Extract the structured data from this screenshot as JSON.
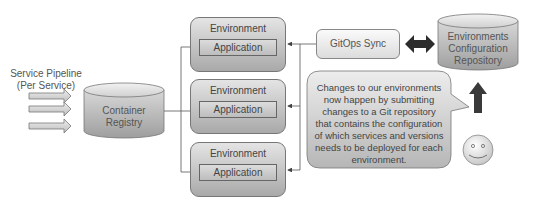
{
  "pipeline": {
    "title_line1": "Service Pipeline",
    "title_line2": "(Per Service)",
    "arrow_count": 3
  },
  "container_registry": {
    "line1": "Container",
    "line2": "Registry"
  },
  "environments": [
    {
      "title": "Environment",
      "app": "Application"
    },
    {
      "title": "Environment",
      "app": "Application"
    },
    {
      "title": "Environment",
      "app": "Application"
    }
  ],
  "gitops_sync": {
    "label": "GitOps Sync"
  },
  "config_repo": {
    "line1": "Environments",
    "line2": "Configuration",
    "line3": "Repository"
  },
  "callout": {
    "text": "Changes to our environments now happen by submitting changes to a Git repository that contains the configuration of which services and versions needs to be deployed for each environment."
  },
  "actor": {
    "icon": "smiley-face-icon"
  },
  "colors": {
    "box_top": "#e4e4e4",
    "box_bottom": "#a9a9a9",
    "arrow_dark": "#333333",
    "line": "#555555"
  }
}
